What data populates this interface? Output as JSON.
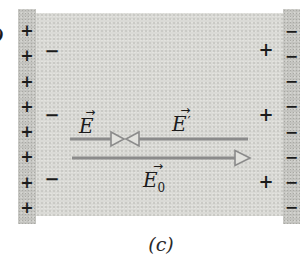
{
  "figure": {
    "caption": "(c)",
    "stray_mark": ")",
    "plates": {
      "left_charges": [
        "+",
        "+",
        "+",
        "+",
        "+",
        "+",
        "+",
        "+"
      ],
      "right_charges": [
        "−",
        "−",
        "−",
        "−",
        "−",
        "−",
        "−",
        "−"
      ]
    },
    "bound_charges": {
      "left": [
        "−",
        "−",
        "−"
      ],
      "right": [
        "+",
        "+",
        "+"
      ]
    },
    "field_labels": {
      "vec_arrow": "→",
      "e": {
        "base": "E"
      },
      "e_prime": {
        "base": "E",
        "prime": "′"
      },
      "e0": {
        "base": "E",
        "sub": "0"
      }
    },
    "colors": {
      "arrow": "#8b8b8b",
      "arrowhead_fill": "#e2e2de",
      "plate": "#c3c3bf",
      "dielectric": "#dadad6",
      "charge": "#1b1b1b"
    }
  }
}
